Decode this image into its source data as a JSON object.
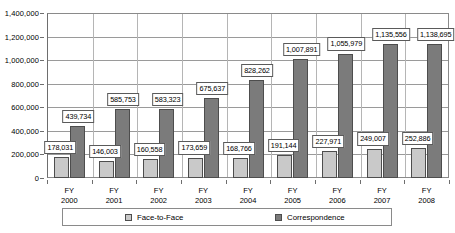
{
  "chart_data": {
    "type": "bar",
    "title": "",
    "xlabel": "",
    "ylabel": "",
    "ylim": [
      0,
      1400000
    ],
    "ytick_labels": [
      "0",
      "200,000",
      "400,000",
      "600,000",
      "800,000",
      "1,000,000",
      "1,200,000",
      "1,400,000"
    ],
    "ytick_values": [
      0,
      200000,
      400000,
      600000,
      800000,
      1000000,
      1200000,
      1400000
    ],
    "grid": true,
    "legend_position": "bottom",
    "categories": [
      "FY\n2000",
      "FY\n2001",
      "FY\n2002",
      "FY\n2003",
      "FY\n2004",
      "FY\n2005",
      "FY\n2006",
      "FY\n2007",
      "FY\n2008"
    ],
    "category_lines": [
      [
        "FY",
        "2000"
      ],
      [
        "FY",
        "2001"
      ],
      [
        "FY",
        "2002"
      ],
      [
        "FY",
        "2003"
      ],
      [
        "FY",
        "2004"
      ],
      [
        "FY",
        "2005"
      ],
      [
        "FY",
        "2006"
      ],
      [
        "FY",
        "2007"
      ],
      [
        "FY",
        "2008"
      ]
    ],
    "series": [
      {
        "name": "Face-to-Face",
        "color": "#c9c9c9",
        "values": [
          178031,
          146003,
          160558,
          173659,
          168766,
          191144,
          227971,
          249007,
          252886
        ],
        "labels": [
          "178,031",
          "146,003",
          "160,558",
          "173,659",
          "168,766",
          "191,144",
          "227,971",
          "249,007",
          "252,886"
        ]
      },
      {
        "name": "Correspondence",
        "color": "#7b7b7b",
        "values": [
          439734,
          585753,
          583323,
          675637,
          828262,
          1007891,
          1055979,
          1135556,
          1138695
        ],
        "labels": [
          "439,734",
          "585,753",
          "583,323",
          "675,637",
          "828,262",
          "1,007,891",
          "1,055,979",
          "1,135,556",
          "1,138,695"
        ]
      }
    ]
  },
  "legend": {
    "entries": [
      {
        "label": "Face-to-Face"
      },
      {
        "label": "Correspondence"
      }
    ]
  }
}
